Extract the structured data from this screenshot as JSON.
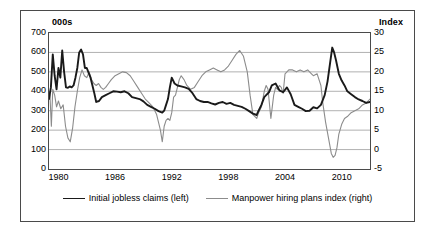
{
  "chart_data": {
    "type": "line",
    "title": "",
    "subtitle": "",
    "xlabel": "",
    "ylabel": "000s",
    "ylabel_right": "Index",
    "grid": true,
    "legend_position": "bottom",
    "xlim": [
      1979.0,
      2013.0
    ],
    "xticks": [
      "1980",
      "1986",
      "1992",
      "1998",
      "2004",
      "2010"
    ],
    "xtick_values": [
      1980,
      1986,
      1992,
      1998,
      2004,
      2010
    ],
    "ylim": [
      0,
      700
    ],
    "yticks": [
      "0",
      "100",
      "200",
      "300",
      "400",
      "500",
      "600",
      "700"
    ],
    "ytick_values": [
      0,
      100,
      200,
      300,
      400,
      500,
      600,
      700
    ],
    "ylim_right": [
      -5,
      30
    ],
    "yticks_right": [
      "-5",
      "0",
      "5",
      "10",
      "15",
      "20",
      "25",
      "30"
    ],
    "ytick_values_right": [
      -5,
      0,
      5,
      10,
      15,
      20,
      25,
      30
    ],
    "series": [
      {
        "name": "Initial jobless claims (left)",
        "axis": "left",
        "color": "#1a1a1a",
        "width": 1.9,
        "x": [
          1979.0,
          1979.2,
          1979.4,
          1979.6,
          1979.8,
          1980.0,
          1980.2,
          1980.4,
          1980.6,
          1980.8,
          1981.0,
          1981.2,
          1981.4,
          1981.6,
          1981.8,
          1982.0,
          1982.2,
          1982.4,
          1982.6,
          1982.8,
          1983.0,
          1983.2,
          1983.4,
          1983.6,
          1983.8,
          1984.0,
          1984.3,
          1984.6,
          1985.0,
          1985.4,
          1985.8,
          1986.2,
          1986.6,
          1987.0,
          1987.4,
          1987.8,
          1988.2,
          1988.6,
          1989.0,
          1989.4,
          1989.8,
          1990.2,
          1990.6,
          1991.0,
          1991.2,
          1991.4,
          1991.6,
          1991.8,
          1992.0,
          1992.3,
          1992.6,
          1993.0,
          1993.4,
          1993.8,
          1994.2,
          1994.6,
          1995.0,
          1995.4,
          1995.8,
          1996.2,
          1996.6,
          1997.0,
          1997.4,
          1997.8,
          1998.2,
          1998.6,
          1999.0,
          1999.4,
          1999.8,
          2000.2,
          2000.6,
          2001.0,
          2001.2,
          2001.5,
          2001.8,
          2002.0,
          2002.3,
          2002.6,
          2003.0,
          2003.4,
          2003.8,
          2004.2,
          2004.6,
          2005.0,
          2005.4,
          2005.8,
          2006.2,
          2006.6,
          2007.0,
          2007.4,
          2007.8,
          2008.2,
          2008.5,
          2008.8,
          2009.0,
          2009.2,
          2009.4,
          2009.7,
          2010.0,
          2010.3,
          2010.6,
          2011.0,
          2011.4,
          2011.8,
          2012.2,
          2012.6,
          2013.0
        ],
        "y": [
          360,
          420,
          590,
          480,
          410,
          520,
          470,
          610,
          500,
          420,
          418,
          425,
          420,
          430,
          470,
          520,
          600,
          615,
          590,
          520,
          520,
          495,
          470,
          430,
          390,
          345,
          350,
          370,
          380,
          390,
          400,
          398,
          395,
          400,
          390,
          370,
          365,
          360,
          348,
          330,
          320,
          310,
          298,
          290,
          300,
          330,
          360,
          420,
          470,
          440,
          430,
          425,
          420,
          412,
          390,
          360,
          350,
          345,
          345,
          338,
          332,
          340,
          345,
          335,
          340,
          330,
          325,
          320,
          310,
          298,
          285,
          278,
          300,
          330,
          370,
          380,
          395,
          430,
          440,
          405,
          395,
          420,
          385,
          330,
          320,
          310,
          298,
          300,
          318,
          312,
          330,
          380,
          450,
          555,
          625,
          600,
          560,
          490,
          455,
          430,
          400,
          385,
          370,
          358,
          350,
          340,
          345
        ]
      },
      {
        "name": "Manpower hiring plans index (right)",
        "axis": "right",
        "color": "#8c8c8c",
        "width": 1.1,
        "x": [
          1979.0,
          1979.1,
          1979.25,
          1979.4,
          1979.6,
          1979.8,
          1980.0,
          1980.25,
          1980.5,
          1980.75,
          1981.0,
          1981.25,
          1981.5,
          1981.75,
          1982.0,
          1982.25,
          1982.5,
          1982.75,
          1983.0,
          1983.25,
          1983.5,
          1983.75,
          1984.0,
          1984.25,
          1984.5,
          1984.75,
          1985.0,
          1985.3,
          1985.6,
          1986.0,
          1986.4,
          1986.8,
          1987.2,
          1987.6,
          1988.0,
          1988.4,
          1988.8,
          1989.2,
          1989.6,
          1990.0,
          1990.4,
          1990.8,
          1991.0,
          1991.2,
          1991.4,
          1991.6,
          1991.8,
          1992.0,
          1992.2,
          1992.4,
          1992.6,
          1992.8,
          1993.0,
          1993.3,
          1993.6,
          1994.0,
          1994.4,
          1994.8,
          1995.2,
          1995.6,
          1996.0,
          1996.4,
          1996.8,
          1997.2,
          1997.6,
          1998.0,
          1998.4,
          1998.8,
          1999.2,
          1999.6,
          2000.0,
          2000.3,
          2000.6,
          2001.0,
          2001.2,
          2001.5,
          2001.8,
          2002.0,
          2002.2,
          2002.5,
          2002.8,
          2003.0,
          2003.2,
          2003.4,
          2003.6,
          2003.8,
          2004.0,
          2004.4,
          2004.8,
          2005.2,
          2005.6,
          2006.0,
          2006.4,
          2006.8,
          2007.0,
          2007.4,
          2007.8,
          2008.0,
          2008.3,
          2008.6,
          2008.9,
          2009.1,
          2009.3,
          2009.5,
          2009.7,
          2010.0,
          2010.3,
          2010.6,
          2011.0,
          2011.4,
          2011.8,
          2012.2,
          2012.6,
          2013.0
        ],
        "y": [
          15.0,
          14.0,
          6.0,
          15.5,
          14.0,
          11.0,
          12.5,
          10.5,
          11.5,
          6.0,
          3.0,
          2.0,
          5.5,
          11.0,
          15.0,
          18.5,
          20.5,
          19.0,
          18.5,
          20.0,
          18.0,
          17.0,
          16.5,
          17.0,
          16.0,
          15.5,
          16.0,
          17.0,
          18.0,
          19.0,
          19.5,
          20.0,
          19.8,
          19.0,
          17.5,
          16.0,
          14.5,
          13.0,
          12.0,
          11.0,
          9.0,
          5.0,
          2.0,
          6.0,
          7.5,
          8.0,
          7.5,
          9.5,
          13.5,
          14.0,
          16.0,
          18.0,
          19.0,
          18.0,
          16.5,
          15.5,
          16.0,
          17.5,
          19.0,
          20.0,
          20.5,
          21.0,
          20.5,
          20.0,
          20.5,
          21.5,
          23.0,
          24.5,
          25.5,
          24.0,
          20.0,
          14.0,
          9.0,
          8.0,
          9.5,
          11.0,
          15.0,
          16.5,
          15.5,
          8.0,
          14.0,
          16.0,
          15.5,
          16.5,
          16.0,
          14.5,
          19.5,
          20.5,
          20.5,
          20.0,
          20.5,
          20.0,
          20.5,
          19.5,
          19.0,
          19.5,
          16.5,
          12.0,
          7.0,
          3.0,
          -1.0,
          -2.0,
          -1.5,
          0.5,
          4.0,
          6.5,
          8.0,
          8.5,
          9.5,
          10.0,
          10.5,
          11.5,
          12.0,
          13.0
        ]
      }
    ]
  },
  "axes": {
    "left_unit": "000s",
    "right_unit": "Index"
  },
  "legend": {
    "entries": [
      {
        "label": "Initial jobless claims (left)",
        "icon": "line-sample-black"
      },
      {
        "label": "Manpower hiring plans index (right)",
        "icon": "line-sample-grey"
      }
    ]
  },
  "colors": {
    "claims_line": "#1a1a1a",
    "index_line": "#8c8c8c",
    "gridline": "#a8a8a8",
    "frame": "#4a4a4a",
    "background": "#ffffff",
    "text": "#000000"
  }
}
